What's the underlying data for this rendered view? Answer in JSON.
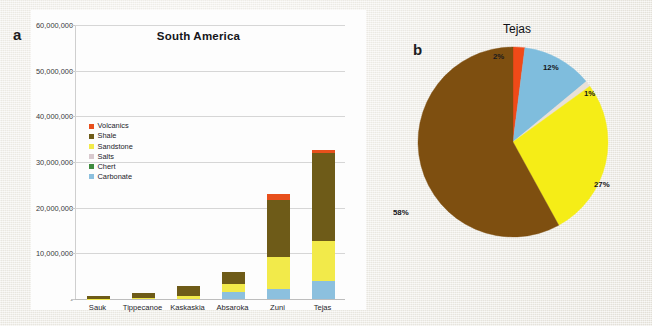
{
  "figure": {
    "panel_a_letter": "a",
    "panel_b_letter": "b"
  },
  "bar_chart": {
    "title": "South America",
    "legend": [
      {
        "label": "Volcanics",
        "color": "#E8501C"
      },
      {
        "label": "Shale",
        "color": "#6E5B18"
      },
      {
        "label": "Sandstone",
        "color": "#F2EA4A"
      },
      {
        "label": "Salts",
        "color": "#D8C9CE"
      },
      {
        "label": "Chert",
        "color": "#3E8B3E"
      },
      {
        "label": "Carbonate",
        "color": "#8CC0DE"
      }
    ],
    "y_ticks": [
      "60,000,000",
      "50,000,000",
      "40,000,000",
      "30,000,000",
      "20,000,000",
      "10,000,000",
      "-"
    ],
    "x_labels": [
      "Sauk",
      "Tippecanoe",
      "Kaskaskia",
      "Absaroka",
      "Zuni",
      "Tejas"
    ]
  },
  "pie_chart": {
    "title": "Tejas",
    "labels": {
      "volcanics": "2%",
      "carbonate": "12%",
      "salts": "1%",
      "sandstone": "27%",
      "shale": "58%"
    }
  },
  "chart_data": [
    {
      "type": "bar",
      "title": "South America",
      "stacked": true,
      "xlabel": "",
      "ylabel": "",
      "ylim": [
        0,
        60000000
      ],
      "yticks": [
        0,
        10000000,
        20000000,
        30000000,
        40000000,
        50000000,
        60000000
      ],
      "ytick_labels": [
        "-",
        "10,000,000",
        "20,000,000",
        "30,000,000",
        "40,000,000",
        "50,000,000",
        "60,000,000"
      ],
      "grid": true,
      "legend_position": "inside-upper-left",
      "categories": [
        "Sauk",
        "Tippecanoe",
        "Kaskaskia",
        "Absaroka",
        "Zuni",
        "Tejas"
      ],
      "series": [
        {
          "name": "Carbonate",
          "color": "#8CC0DE",
          "values": [
            0,
            0,
            0,
            1500000,
            2100000,
            4000000
          ]
        },
        {
          "name": "Chert",
          "color": "#3E8B3E",
          "values": [
            0,
            0,
            0,
            0,
            0,
            0
          ]
        },
        {
          "name": "Salts",
          "color": "#D8C9CE",
          "values": [
            0,
            0,
            0,
            0,
            0,
            0
          ]
        },
        {
          "name": "Sandstone",
          "color": "#F2EA4A",
          "values": [
            100000,
            300000,
            600000,
            1700000,
            7000000,
            8700000
          ]
        },
        {
          "name": "Shale",
          "color": "#6E5B18",
          "values": [
            500000,
            1100000,
            2300000,
            2800000,
            12600000,
            19300000
          ]
        },
        {
          "name": "Volcanics",
          "color": "#E8501C",
          "values": [
            0,
            0,
            0,
            0,
            1300000,
            600000
          ]
        }
      ],
      "totals": [
        600000,
        1400000,
        2900000,
        6000000,
        23000000,
        32600000
      ]
    },
    {
      "type": "pie",
      "title": "Tejas",
      "labels": [
        "Volcanics",
        "Carbonate",
        "Salts",
        "Sandstone",
        "Shale"
      ],
      "values": [
        2,
        12,
        1,
        27,
        58
      ],
      "value_labels": [
        "2%",
        "12%",
        "1%",
        "27%",
        "58%"
      ],
      "colors": [
        "#F04A18",
        "#7FBDDD",
        "#E8E0D8",
        "#F5ED17",
        "#7E4F10"
      ],
      "start_angle_deg": 0,
      "direction": "clockwise",
      "legend_position": "none"
    }
  ]
}
